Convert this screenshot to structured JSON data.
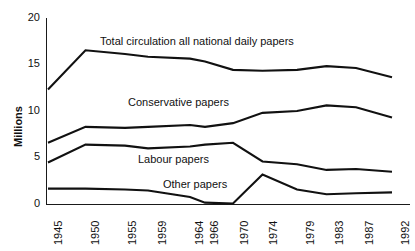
{
  "chart_data": {
    "type": "line",
    "title": "",
    "xlabel": "",
    "ylabel": "Millions",
    "ylim": [
      0,
      20
    ],
    "yticks": [
      0,
      5,
      10,
      15,
      20
    ],
    "ytick_labels": [
      "0",
      "5",
      "10",
      "15",
      "20"
    ],
    "grid": false,
    "legend_position": "inline-annotations",
    "categories": [
      "1945",
      "1950",
      "1955",
      "1959",
      "1964",
      "1966",
      "1970",
      "1974",
      "1979",
      "1983",
      "1987",
      "1992"
    ],
    "series": [
      {
        "name": "Total circulation all national daily papers",
        "values": [
          12.3,
          16.5,
          16.1,
          15.8,
          15.6,
          15.3,
          14.4,
          14.3,
          14.4,
          14.8,
          14.6,
          13.6
        ]
      },
      {
        "name": "Conservative papers",
        "values": [
          6.6,
          8.3,
          8.2,
          8.3,
          8.5,
          8.3,
          8.7,
          9.8,
          10.0,
          10.6,
          10.4,
          9.3
        ]
      },
      {
        "name": "Labour papers",
        "values": [
          4.5,
          6.4,
          6.3,
          6.0,
          6.2,
          6.4,
          6.6,
          4.6,
          4.3,
          3.7,
          3.8,
          3.5
        ]
      },
      {
        "name": "Other papers",
        "values": [
          1.7,
          1.7,
          1.6,
          1.5,
          0.8,
          0.2,
          0.1,
          3.2,
          1.6,
          1.1,
          1.2,
          1.3
        ]
      }
    ],
    "annotations": [
      {
        "text": "Total circulation all national daily papers",
        "series": "Total circulation all national daily papers"
      },
      {
        "text": "Conservative papers",
        "series": "Conservative papers"
      },
      {
        "text": "Labour papers",
        "series": "Labour papers"
      },
      {
        "text": "Other papers",
        "series": "Other papers"
      }
    ],
    "colors": {
      "line": "#111111",
      "axis": "#1a1a1a",
      "background": "#ffffff"
    }
  },
  "axis": {
    "y_title": "Millions"
  },
  "labels": {
    "total": "Total circulation all national daily papers",
    "conservative": "Conservative papers",
    "labour": "Labour papers",
    "other": "Other papers"
  }
}
